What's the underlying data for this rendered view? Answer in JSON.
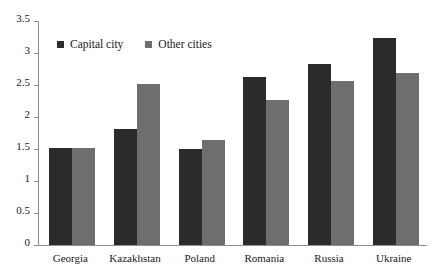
{
  "chart_data": {
    "type": "bar",
    "title": "",
    "subtitle": "",
    "xlabel": "",
    "ylabel": "",
    "categories": [
      "Georgia",
      "Kazakhstan",
      "Poland",
      "Romania",
      "Russia",
      "Ukraine"
    ],
    "series": [
      {
        "name": "Capital city",
        "color": "#2b2b2b",
        "values": [
          1.52,
          1.82,
          1.5,
          2.63,
          2.83,
          3.23
        ]
      },
      {
        "name": "Other cities",
        "color": "#6e6e6e",
        "values": [
          1.51,
          2.52,
          1.64,
          2.27,
          2.57,
          2.69
        ]
      }
    ],
    "ylim": [
      0,
      3.5
    ],
    "yticks": [
      0,
      0.5,
      1,
      1.5,
      2,
      2.5,
      3,
      3.5
    ],
    "ytick_labels": [
      "0",
      "0.5",
      "1",
      "1.5",
      "2",
      "2.5",
      "3",
      "3.5"
    ],
    "grid": false,
    "legend_position": "top-left-inside",
    "annotations": []
  },
  "legend": {
    "entries": [
      {
        "label": "Capital city",
        "color": "#2b2b2b"
      },
      {
        "label": "Other cities",
        "color": "#6e6e6e"
      }
    ]
  },
  "axes": {
    "axis_color": "#8e8e8e"
  }
}
